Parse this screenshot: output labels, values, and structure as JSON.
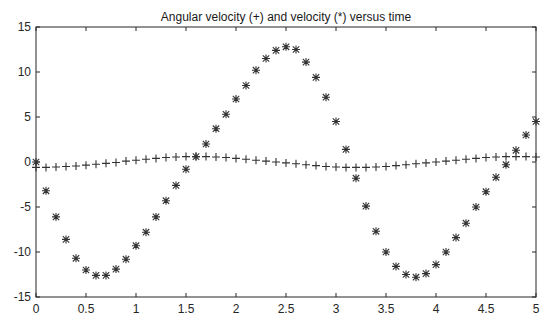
{
  "chart_data": {
    "type": "scatter",
    "title": "Angular velocity (+) and velocity (*) versus time",
    "xlabel": "",
    "ylabel": "",
    "xlim": [
      0,
      5
    ],
    "ylim": [
      -15,
      15
    ],
    "grid": false,
    "legend": null,
    "x_ticks": [
      0,
      0.5,
      1,
      1.5,
      2,
      2.5,
      3,
      3.5,
      4,
      4.5,
      5
    ],
    "x_tick_labels": [
      "0",
      "0.5",
      "1",
      "1.5",
      "2",
      "2.5",
      "3",
      "3.5",
      "4",
      "4.5",
      "5"
    ],
    "y_ticks": [
      -15,
      -10,
      -5,
      0,
      5,
      10,
      15
    ],
    "y_tick_labels": [
      "-15",
      "-10",
      "-5",
      "0",
      "5",
      "10",
      "15"
    ],
    "x": [
      0.0,
      0.1,
      0.2,
      0.3,
      0.4,
      0.5,
      0.6,
      0.7,
      0.8,
      0.9,
      1.0,
      1.1,
      1.2,
      1.3,
      1.4,
      1.5,
      1.6,
      1.7,
      1.8,
      1.9,
      2.0,
      2.1,
      2.2,
      2.3,
      2.4,
      2.5,
      2.6,
      2.7,
      2.8,
      2.9,
      3.0,
      3.1,
      3.2,
      3.3,
      3.4,
      3.5,
      3.6,
      3.7,
      3.8,
      3.9,
      4.0,
      4.1,
      4.2,
      4.3,
      4.4,
      4.5,
      4.6,
      4.7,
      4.8,
      4.9,
      5.0
    ],
    "series": [
      {
        "name": "Angular velocity",
        "marker": "+",
        "color": "#333333",
        "values": [
          -0.6,
          -0.6,
          -0.55,
          -0.5,
          -0.45,
          -0.35,
          -0.25,
          -0.15,
          -0.05,
          0.1,
          0.2,
          0.3,
          0.4,
          0.5,
          0.55,
          0.6,
          0.6,
          0.6,
          0.55,
          0.5,
          0.4,
          0.3,
          0.2,
          0.1,
          0.0,
          -0.1,
          -0.2,
          -0.3,
          -0.4,
          -0.5,
          -0.55,
          -0.6,
          -0.6,
          -0.6,
          -0.55,
          -0.5,
          -0.4,
          -0.3,
          -0.2,
          -0.1,
          0.0,
          0.1,
          0.2,
          0.3,
          0.4,
          0.5,
          0.55,
          0.6,
          0.6,
          0.6,
          0.55
        ]
      },
      {
        "name": "Velocity",
        "marker": "*",
        "color": "#333333",
        "values": [
          0.0,
          -3.2,
          -6.1,
          -8.6,
          -10.7,
          -12.0,
          -12.6,
          -12.6,
          -11.9,
          -10.8,
          -9.3,
          -7.8,
          -6.1,
          -4.3,
          -2.6,
          -0.8,
          0.6,
          2.0,
          3.7,
          5.3,
          7.0,
          8.5,
          10.2,
          11.5,
          12.4,
          12.8,
          12.5,
          11.1,
          9.4,
          7.2,
          4.5,
          1.4,
          -1.8,
          -4.9,
          -7.7,
          -10.0,
          -11.6,
          -12.5,
          -12.8,
          -12.4,
          -11.4,
          -10.0,
          -8.4,
          -6.8,
          -5.0,
          -3.3,
          -1.7,
          -0.3,
          1.3,
          3.0,
          4.5
        ]
      }
    ]
  },
  "page": {
    "title": "Angular velocity (+) and velocity (*) versus time"
  }
}
